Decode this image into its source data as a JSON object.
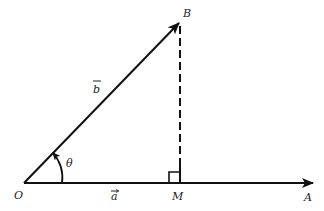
{
  "diagram": {
    "type": "vector-projection",
    "colors": {
      "stroke": "#111111",
      "text": "#222222",
      "background": "#ffffff"
    },
    "points": {
      "O": {
        "label": "O"
      },
      "A": {
        "label": "A"
      },
      "B": {
        "label": "B"
      },
      "M": {
        "label": "M"
      }
    },
    "vectors": {
      "a": {
        "label": "a",
        "arrow": "→",
        "from": "O",
        "to": "A"
      },
      "b": {
        "label": "b",
        "arrow": "→",
        "from": "O",
        "to": "B"
      }
    },
    "angle": {
      "label": "θ",
      "between": [
        "a",
        "b"
      ]
    },
    "perpendicular": {
      "from": "B",
      "foot": "M",
      "style": "dashed",
      "right_angle_marker": true
    }
  }
}
